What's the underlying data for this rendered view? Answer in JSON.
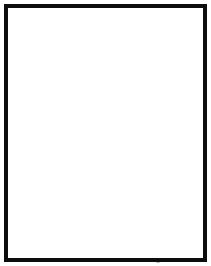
{
  "figure": {
    "kind": "line-drawing",
    "background_color": "#ffffff",
    "frame": {
      "border_color": "#0d0d0d",
      "border_width_px": 4,
      "margin_px": 4
    },
    "ink": {
      "line_color": "#2b2b2b",
      "soft_line_color": "#4a4a4a",
      "bold_line_color": "#0d0d0d",
      "label_color": "#1a1a1a"
    },
    "panels": [
      {
        "id": "upper",
        "position": "top",
        "label": "N",
        "label_present": true,
        "arrow_present": false,
        "description": "Wrist tracing with normal contour, labelled N"
      },
      {
        "id": "lower",
        "position": "bottom",
        "label": "",
        "label_present": false,
        "arrow_present": true,
        "description": "Wrist tracing with arrow indicating contour step"
      }
    ]
  }
}
